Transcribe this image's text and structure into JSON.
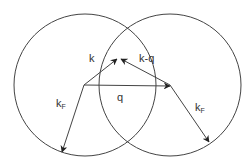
{
  "diagram": {
    "colors": {
      "stroke": "#444444",
      "text": "#333333",
      "background": "#ffffff"
    },
    "circles": [
      {
        "id": "left",
        "cx": 85,
        "cy": 85,
        "r": 71
      },
      {
        "id": "right",
        "cx": 170,
        "cy": 85,
        "r": 71
      }
    ],
    "vectors": [
      {
        "id": "kF-left",
        "from": [
          84,
          85
        ],
        "to": [
          62,
          152
        ],
        "label": "k",
        "subscript": "F",
        "label_pos": [
          56,
          107
        ]
      },
      {
        "id": "k",
        "from": [
          84,
          85
        ],
        "to": [
          117,
          59
        ],
        "label": "k",
        "subscript": "",
        "label_pos": [
          89,
          62
        ]
      },
      {
        "id": "q",
        "from": [
          84,
          85
        ],
        "to": [
          170,
          86
        ],
        "label": "q",
        "subscript": "",
        "label_pos": [
          117,
          101
        ]
      },
      {
        "id": "k-minus-q",
        "from": [
          170,
          85
        ],
        "to": [
          121,
          59
        ],
        "label": "k-q",
        "subscript": "",
        "label_pos": [
          139,
          62
        ]
      },
      {
        "id": "kF-right",
        "from": [
          170,
          85
        ],
        "to": [
          209,
          142
        ],
        "label": "k",
        "subscript": "F",
        "label_pos": [
          195,
          111
        ]
      }
    ]
  }
}
